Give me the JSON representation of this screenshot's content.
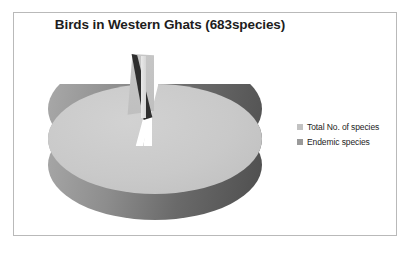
{
  "figure": {
    "background_color": "#ffffff",
    "frame_color": "#b9b9b9"
  },
  "chart_data": {
    "type": "pie",
    "title": "Birds in Western Ghats (683species)",
    "xlabel": "",
    "ylabel": "",
    "categories": [
      "Total No. of species",
      "Endemic species"
    ],
    "values": [
      683,
      16
    ],
    "total_label": "683species",
    "legend_position": "right",
    "grid": false,
    "three_d": true,
    "exploded_slice": "Endemic species",
    "slice_colors": [
      "#c9c9c9",
      "#4a4a4a"
    ],
    "annotations": []
  },
  "legend": {
    "items": [
      {
        "label": "Total No. of species",
        "swatch_color": "#c2c2c2"
      },
      {
        "label": "Endemic species",
        "swatch_color": "#9a9a9a"
      }
    ]
  }
}
